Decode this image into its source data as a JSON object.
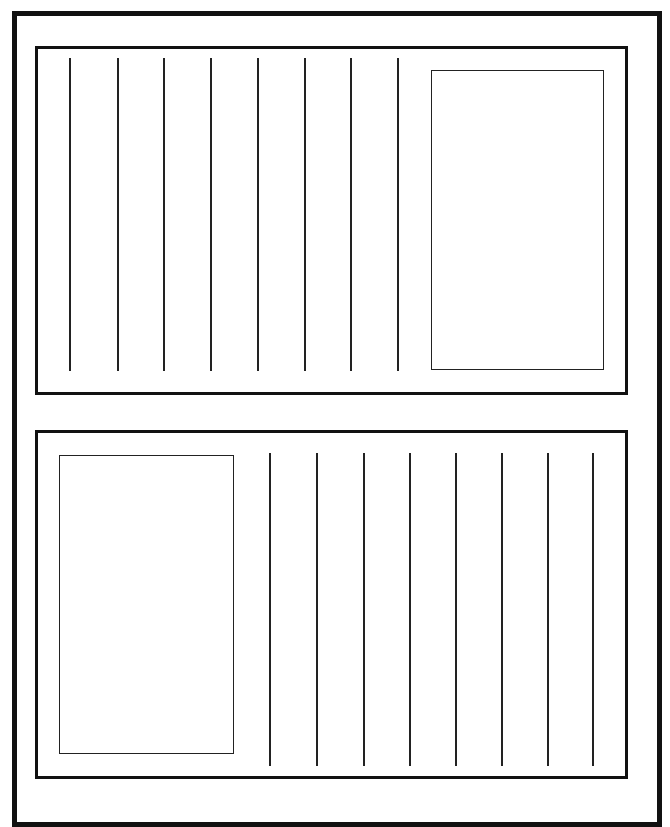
{
  "page": {
    "title": "",
    "background": "#ffffff",
    "ink_color": "#111111"
  },
  "panels": [
    {
      "id": "top-panel",
      "position": "top",
      "picture_box_side": "right",
      "line_count": 8,
      "lines_x": [
        69,
        117,
        163,
        210,
        257,
        304,
        350,
        397
      ],
      "lines_y": [
        58,
        371
      ],
      "picture_box": {
        "x": 431,
        "y": 70,
        "w": 173,
        "h": 300
      }
    },
    {
      "id": "bottom-panel",
      "position": "bottom",
      "picture_box_side": "left",
      "line_count": 8,
      "lines_x": [
        269,
        316,
        363,
        409,
        455,
        501,
        547,
        592
      ],
      "lines_y": [
        453,
        766
      ],
      "picture_box": {
        "x": 59,
        "y": 455,
        "w": 175,
        "h": 299
      }
    }
  ]
}
